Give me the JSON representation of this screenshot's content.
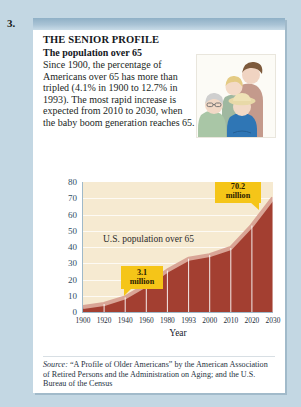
{
  "exercise": {
    "number": "3."
  },
  "panel": {
    "title": "THE SENIOR PROFILE",
    "subtitle": "The population over 65",
    "body": "Since 1900, the percentage of Americans over 65 has more than tripled (4.1% in 1900 to 12.7% in 1993). The most rapid increase is expected from 2010 to 2030, when the baby boom generation reaches 65.",
    "illustration_name": "multigenerational-family-photo"
  },
  "source": {
    "lead": "Source:",
    "text": " “A Profile of Older Americans” by the American Association of Retired Persons and the Administration on Aging; and the U.S. Bureau of the Census"
  },
  "colors": {
    "page_background": "#c3d7e3",
    "panel_header": "#8fb0c6",
    "plot_background": "#f6ead1",
    "area_fill": "#a33f31",
    "area_edge": "#d9a596",
    "callout": "#f5c518",
    "axis_text": "#2f4f66"
  },
  "chart_data": {
    "type": "area",
    "title": "U.S. population over 65",
    "xlabel": "Year",
    "ylabel": "",
    "grid": true,
    "legend": "none",
    "ylim": [
      0,
      80
    ],
    "yticks": [
      0,
      10,
      20,
      30,
      40,
      50,
      60,
      70,
      80
    ],
    "categories": [
      "1900",
      "1920",
      "1940",
      "1960",
      "1980",
      "1993",
      "2000",
      "2010",
      "2020",
      "2030"
    ],
    "values": [
      3.1,
      4.9,
      9.0,
      16.6,
      25.5,
      32.8,
      35.0,
      39.4,
      53.2,
      70.2
    ],
    "units": "millions",
    "annotations": [
      {
        "name": "start-value-callout",
        "label": "3.1\nmillion",
        "value": 3.1,
        "at_category": "1900"
      },
      {
        "name": "end-value-callout",
        "label": "70.2\nmillion",
        "value": 70.2,
        "at_category": "2030"
      }
    ]
  },
  "callouts": {
    "start": {
      "line1": "3.1",
      "line2": "million"
    },
    "end": {
      "line1": "70.2",
      "line2": "million"
    }
  }
}
